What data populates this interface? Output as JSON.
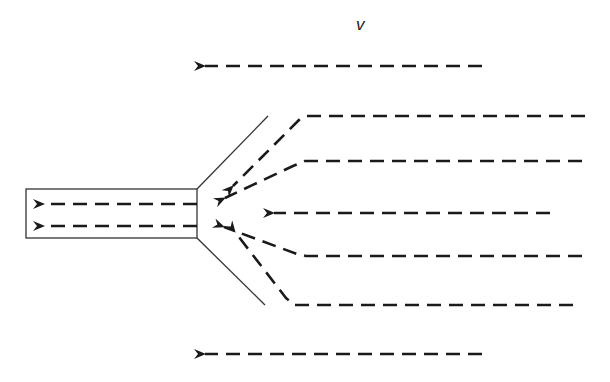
{
  "diagram": {
    "type": "flow-field",
    "label": "v",
    "label_pos": [
      356,
      15
    ],
    "colors": {
      "stroke": "#1a1a1a",
      "background": "#ffffff",
      "outline": "#333333"
    },
    "tube": {
      "x": 26,
      "y": 189,
      "width": 171,
      "height": 49
    },
    "funnel_walls": [
      {
        "from": [
          197,
          189
        ],
        "to": [
          268,
          116
        ]
      },
      {
        "from": [
          197,
          238
        ],
        "to": [
          265,
          305
        ]
      }
    ],
    "streamlines": [
      {
        "id": "outer-top",
        "points": [
          [
            482,
            66
          ],
          [
            205,
            66
          ]
        ]
      },
      {
        "id": "inflow-1",
        "points": [
          [
            585,
            116
          ],
          [
            307,
            116
          ],
          [
            300,
            119
          ],
          [
            233,
            186
          ]
        ]
      },
      {
        "id": "inflow-2",
        "points": [
          [
            582,
            161
          ],
          [
            305,
            161
          ],
          [
            293,
            166
          ],
          [
            225,
            198
          ]
        ]
      },
      {
        "id": "inflow-3",
        "points": [
          [
            550,
            213
          ],
          [
            274,
            213
          ]
        ]
      },
      {
        "id": "inflow-4",
        "points": [
          [
            582,
            256
          ],
          [
            306,
            256
          ],
          [
            297,
            254
          ],
          [
            224,
            227
          ]
        ]
      },
      {
        "id": "inflow-5",
        "points": [
          [
            573,
            305
          ],
          [
            294,
            305
          ],
          [
            286,
            298
          ],
          [
            235,
            232
          ]
        ]
      },
      {
        "id": "tube-upper",
        "points": [
          [
            197,
            204
          ],
          [
            44,
            204
          ]
        ]
      },
      {
        "id": "tube-lower",
        "points": [
          [
            197,
            226
          ],
          [
            44,
            226
          ]
        ]
      },
      {
        "id": "outer-bottom",
        "points": [
          [
            482,
            354
          ],
          [
            205,
            354
          ]
        ]
      }
    ]
  }
}
